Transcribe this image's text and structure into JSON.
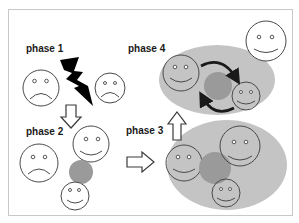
{
  "diagram": {
    "phases": [
      {
        "id": "phase1",
        "label": "phase 1"
      },
      {
        "id": "phase2",
        "label": "phase 2"
      },
      {
        "id": "phase3",
        "label": "phase 3"
      },
      {
        "id": "phase4",
        "label": "phase 4"
      }
    ],
    "colors": {
      "frame": "#c8c8c8",
      "group_fill": "#c4c4c4",
      "central_blob": "#9a9a9a",
      "lightning": "#000000",
      "face_stroke": "#4a4a4a"
    },
    "elements": {
      "phase1": [
        "sad-face",
        "lightning-bolt",
        "sad-face-small"
      ],
      "phase2": [
        "sad-face",
        "happy-face",
        "gray-blob",
        "happy-face-small"
      ],
      "phase3": [
        "group-ellipse",
        "happy-face",
        "gray-blob",
        "happy-face",
        "happy-face-small"
      ],
      "phase4": [
        "group-ellipse",
        "happy-face",
        "gray-blob",
        "happy-face-small",
        "cycle-arrows",
        "outside-happy-face"
      ]
    },
    "transitions": [
      {
        "from": "phase 1",
        "to": "phase 2",
        "direction": "down"
      },
      {
        "from": "phase 2",
        "to": "phase 3",
        "direction": "right"
      },
      {
        "from": "phase 3",
        "to": "phase 4",
        "direction": "up"
      }
    ]
  }
}
